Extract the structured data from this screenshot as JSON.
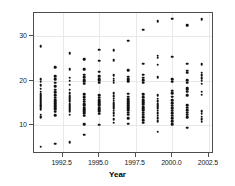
{
  "chart_data": {
    "type": "scatter",
    "title": "",
    "xlabel": "Year",
    "ylabel": "Donors",
    "xlim": [
      1990.55,
      1002.85
    ],
    "ylim": [
      3.6,
      35.2
    ],
    "grid": true,
    "legend": "none",
    "xticks": [
      1992.5,
      1995.0,
      1997.5,
      2000.0,
      2002.5
    ],
    "xticklabels": [
      "1992.5",
      "1995.0",
      "1997.5",
      "2000.0",
      "2002.5"
    ],
    "yticks": [
      10,
      20,
      30
    ],
    "yticklabels": [
      "10",
      "20",
      "30"
    ],
    "note": "x axis spans approximately 1990.6 to 2002.9; points are stacked in discrete yearly columns",
    "x_axis_min": 1990.55,
    "x_axis_max": 2002.85,
    "y_axis_min": 3.6,
    "y_axis_max": 35.2,
    "series": [
      {
        "name": "Donors",
        "marker": "circle",
        "color": "#111111",
        "points": [
          [
            1991,
            5.2
          ],
          [
            1991,
            11.8
          ],
          [
            1991,
            12.0
          ],
          [
            1991,
            12.4
          ],
          [
            1991,
            13.6
          ],
          [
            1991,
            14.0
          ],
          [
            1991,
            14.3
          ],
          [
            1991,
            14.6
          ],
          [
            1991,
            14.9
          ],
          [
            1991,
            15.2
          ],
          [
            1991,
            15.5
          ],
          [
            1991,
            15.8
          ],
          [
            1991,
            16.1
          ],
          [
            1991,
            16.5
          ],
          [
            1991,
            17.0
          ],
          [
            1991,
            17.6
          ],
          [
            1991,
            18.2
          ],
          [
            1991,
            19.0
          ],
          [
            1991,
            19.8
          ],
          [
            1991,
            20.4
          ],
          [
            1991,
            27.7
          ],
          [
            1992,
            5.9
          ],
          [
            1992,
            12.3
          ],
          [
            1992,
            13.1
          ],
          [
            1992,
            13.5
          ],
          [
            1992,
            13.9
          ],
          [
            1992,
            14.2
          ],
          [
            1992,
            14.6
          ],
          [
            1992,
            15.0
          ],
          [
            1992,
            15.4
          ],
          [
            1992,
            15.8
          ],
          [
            1992,
            16.2
          ],
          [
            1992,
            16.8
          ],
          [
            1992,
            17.4
          ],
          [
            1992,
            18.0
          ],
          [
            1992,
            18.8
          ],
          [
            1992,
            19.6
          ],
          [
            1992,
            20.3
          ],
          [
            1992,
            21.1
          ],
          [
            1992,
            23.1
          ],
          [
            1993,
            6.2
          ],
          [
            1993,
            12.4
          ],
          [
            1993,
            13.2
          ],
          [
            1993,
            13.7
          ],
          [
            1993,
            14.1
          ],
          [
            1993,
            14.5
          ],
          [
            1993,
            14.9
          ],
          [
            1993,
            15.3
          ],
          [
            1993,
            15.7
          ],
          [
            1993,
            16.1
          ],
          [
            1993,
            16.6
          ],
          [
            1993,
            17.2
          ],
          [
            1993,
            18.0
          ],
          [
            1993,
            19.1
          ],
          [
            1993,
            20.0
          ],
          [
            1993,
            20.7
          ],
          [
            1993,
            22.6
          ],
          [
            1993,
            26.2
          ],
          [
            1994,
            7.9
          ],
          [
            1994,
            10.3
          ],
          [
            1994,
            12.2
          ],
          [
            1994,
            12.8
          ],
          [
            1994,
            13.2
          ],
          [
            1994,
            13.6
          ],
          [
            1994,
            14.0
          ],
          [
            1994,
            14.4
          ],
          [
            1994,
            14.8
          ],
          [
            1994,
            15.3
          ],
          [
            1994,
            15.8
          ],
          [
            1994,
            16.3
          ],
          [
            1994,
            17.0
          ],
          [
            1994,
            19.4
          ],
          [
            1994,
            19.8
          ],
          [
            1994,
            20.2
          ],
          [
            1994,
            20.8
          ],
          [
            1994,
            21.4
          ],
          [
            1994,
            22.6
          ],
          [
            1994,
            24.9
          ],
          [
            1995,
            10.2
          ],
          [
            1995,
            12.6
          ],
          [
            1995,
            13.2
          ],
          [
            1995,
            13.6
          ],
          [
            1995,
            14.0
          ],
          [
            1995,
            14.4
          ],
          [
            1995,
            14.8
          ],
          [
            1995,
            15.2
          ],
          [
            1995,
            15.7
          ],
          [
            1995,
            16.2
          ],
          [
            1995,
            16.8
          ],
          [
            1995,
            19.6
          ],
          [
            1995,
            20.0
          ],
          [
            1995,
            20.4
          ],
          [
            1995,
            21.0
          ],
          [
            1995,
            22.0
          ],
          [
            1995,
            24.5
          ],
          [
            1995,
            27.0
          ],
          [
            1996,
            10.6
          ],
          [
            1996,
            11.4
          ],
          [
            1996,
            12.2
          ],
          [
            1996,
            12.8
          ],
          [
            1996,
            13.3
          ],
          [
            1996,
            13.8
          ],
          [
            1996,
            14.2
          ],
          [
            1996,
            14.6
          ],
          [
            1996,
            15.0
          ],
          [
            1996,
            15.5
          ],
          [
            1996,
            16.0
          ],
          [
            1996,
            16.6
          ],
          [
            1996,
            17.2
          ],
          [
            1996,
            19.6
          ],
          [
            1996,
            20.0
          ],
          [
            1996,
            20.5
          ],
          [
            1996,
            21.2
          ],
          [
            1996,
            24.6
          ],
          [
            1996,
            26.9
          ],
          [
            1997,
            10.4
          ],
          [
            1997,
            11.6
          ],
          [
            1997,
            12.4
          ],
          [
            1997,
            12.9
          ],
          [
            1997,
            13.4
          ],
          [
            1997,
            13.8
          ],
          [
            1997,
            14.2
          ],
          [
            1997,
            14.6
          ],
          [
            1997,
            15.0
          ],
          [
            1997,
            15.4
          ],
          [
            1997,
            15.9
          ],
          [
            1997,
            16.4
          ],
          [
            1997,
            17.1
          ],
          [
            1997,
            19.9
          ],
          [
            1997,
            20.3
          ],
          [
            1997,
            20.9
          ],
          [
            1997,
            22.4
          ],
          [
            1997,
            29.0
          ],
          [
            1998,
            10.6
          ],
          [
            1998,
            11.2
          ],
          [
            1998,
            11.8
          ],
          [
            1998,
            12.4
          ],
          [
            1998,
            12.9
          ],
          [
            1998,
            13.4
          ],
          [
            1998,
            13.8
          ],
          [
            1998,
            14.2
          ],
          [
            1998,
            14.7
          ],
          [
            1998,
            15.2
          ],
          [
            1998,
            15.7
          ],
          [
            1998,
            16.3
          ],
          [
            1998,
            17.0
          ],
          [
            1998,
            19.6
          ],
          [
            1998,
            20.1
          ],
          [
            1998,
            20.7
          ],
          [
            1998,
            21.4
          ],
          [
            1998,
            23.8
          ],
          [
            1998,
            31.5
          ],
          [
            1999,
            8.6
          ],
          [
            1999,
            11.0
          ],
          [
            1999,
            11.6
          ],
          [
            1999,
            12.2
          ],
          [
            1999,
            12.8
          ],
          [
            1999,
            13.3
          ],
          [
            1999,
            13.8
          ],
          [
            1999,
            14.3
          ],
          [
            1999,
            14.8
          ],
          [
            1999,
            15.4
          ],
          [
            1999,
            16.0
          ],
          [
            1999,
            16.8
          ],
          [
            1999,
            20.8
          ],
          [
            1999,
            23.6
          ],
          [
            1999,
            25.2
          ],
          [
            1999,
            25.6
          ],
          [
            1999,
            33.4
          ],
          [
            2000,
            10.3
          ],
          [
            2000,
            11.0
          ],
          [
            2000,
            11.6
          ],
          [
            2000,
            12.2
          ],
          [
            2000,
            12.8
          ],
          [
            2000,
            13.3
          ],
          [
            2000,
            13.8
          ],
          [
            2000,
            14.4
          ],
          [
            2000,
            15.0
          ],
          [
            2000,
            15.6
          ],
          [
            2000,
            16.4
          ],
          [
            2000,
            17.2
          ],
          [
            2000,
            17.8
          ],
          [
            2000,
            19.8
          ],
          [
            2000,
            20.4
          ],
          [
            2000,
            25.4
          ],
          [
            2000,
            33.9
          ],
          [
            2001,
            9.5
          ],
          [
            2001,
            11.8
          ],
          [
            2001,
            12.4
          ],
          [
            2001,
            12.9
          ],
          [
            2001,
            13.4
          ],
          [
            2001,
            14.0
          ],
          [
            2001,
            14.6
          ],
          [
            2001,
            16.8
          ],
          [
            2001,
            17.6
          ],
          [
            2001,
            18.0
          ],
          [
            2001,
            18.4
          ],
          [
            2001,
            19.6
          ],
          [
            2001,
            20.2
          ],
          [
            2001,
            21.8
          ],
          [
            2001,
            22.3
          ],
          [
            2001,
            23.8
          ],
          [
            2001,
            32.4
          ],
          [
            2002,
            10.8
          ],
          [
            2002,
            11.4
          ],
          [
            2002,
            12.0
          ],
          [
            2002,
            12.6
          ],
          [
            2002,
            13.2
          ],
          [
            2002,
            16.9
          ],
          [
            2002,
            17.6
          ],
          [
            2002,
            19.4
          ],
          [
            2002,
            20.0
          ],
          [
            2002,
            20.6
          ],
          [
            2002,
            21.2
          ],
          [
            2002,
            21.8
          ],
          [
            2002,
            23.7
          ],
          [
            2002,
            33.8
          ]
        ]
      }
    ]
  }
}
